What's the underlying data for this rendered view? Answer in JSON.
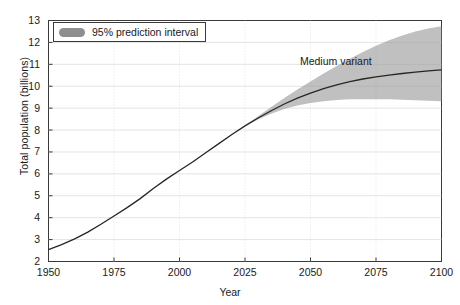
{
  "chart_data": {
    "type": "line",
    "title": "",
    "xlabel": "Year",
    "ylabel": "Total population (billions)",
    "xlim": [
      1950,
      2100
    ],
    "ylim": [
      2,
      13
    ],
    "xticks": [
      1950,
      1975,
      2000,
      2025,
      2050,
      2075,
      2100
    ],
    "yticks": [
      2,
      3,
      4,
      5,
      6,
      7,
      8,
      9,
      10,
      11,
      12,
      13
    ],
    "grid": true,
    "legend_position": "top-left",
    "annotations": [
      {
        "text": "Medium variant",
        "x": 2062,
        "y": 11.1
      }
    ],
    "series": [
      {
        "name": "Medium variant",
        "type": "line",
        "color": "#262626",
        "x": [
          1950,
          1955,
          1960,
          1965,
          1970,
          1975,
          1980,
          1985,
          1990,
          1995,
          2000,
          2005,
          2010,
          2015,
          2020,
          2025,
          2030,
          2035,
          2040,
          2045,
          2050,
          2055,
          2060,
          2065,
          2070,
          2075,
          2080,
          2085,
          2090,
          2095,
          2100
        ],
        "values": [
          2.54,
          2.77,
          3.03,
          3.34,
          3.7,
          4.08,
          4.46,
          4.87,
          5.33,
          5.76,
          6.15,
          6.54,
          6.96,
          7.38,
          7.8,
          8.19,
          8.55,
          8.88,
          9.19,
          9.46,
          9.69,
          9.89,
          10.06,
          10.21,
          10.33,
          10.43,
          10.51,
          10.58,
          10.64,
          10.7,
          10.75
        ]
      },
      {
        "name": "95% prediction interval",
        "type": "band",
        "color": "#9a9a9a",
        "x": [
          2025,
          2030,
          2035,
          2040,
          2045,
          2050,
          2055,
          2060,
          2065,
          2070,
          2075,
          2080,
          2085,
          2090,
          2095,
          2100
        ],
        "lower": [
          8.17,
          8.48,
          8.74,
          8.96,
          9.12,
          9.24,
          9.32,
          9.37,
          9.4,
          9.41,
          9.41,
          9.4,
          9.38,
          9.36,
          9.34,
          9.31
        ],
        "upper": [
          8.21,
          8.63,
          9.05,
          9.46,
          9.85,
          10.22,
          10.58,
          10.92,
          11.25,
          11.56,
          11.85,
          12.1,
          12.32,
          12.5,
          12.64,
          12.74
        ]
      }
    ]
  },
  "legend": {
    "label": "95% prediction interval"
  },
  "annotation": {
    "medium_variant": "Medium variant"
  },
  "axes": {
    "x_title": "Year",
    "y_title": "Total population (billions)"
  },
  "colors": {
    "band": "#9a9a9a",
    "line": "#262626",
    "grid": "#d8d8d8",
    "frame": "#3a3a3a"
  }
}
